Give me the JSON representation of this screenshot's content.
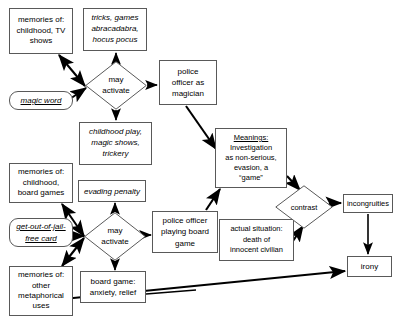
{
  "diagram": {
    "style": {
      "stroke": "#595959",
      "edge_color": "#000000",
      "background": "#ffffff",
      "text_color": "#000000"
    },
    "nodes": [
      {
        "id": "memories-childhood-tv",
        "shape": "rect",
        "text": "memories of:\nchildhood, TV\nshows",
        "italic": false,
        "x": 9,
        "y": 8,
        "w": 64,
        "h": 46
      },
      {
        "id": "tricks-games",
        "shape": "rect",
        "text": "tricks, games\nabracadabra,\nhocus pocus",
        "italic": true,
        "x": 83,
        "y": 8,
        "w": 64,
        "h": 43
      },
      {
        "id": "magic-word",
        "shape": "rounded",
        "text": "magic word",
        "italic": true,
        "underline": true,
        "x": 9,
        "y": 91,
        "w": 64,
        "h": 19
      },
      {
        "id": "may-activate-top",
        "shape": "diamond",
        "text": "may\nactivate",
        "italic": false,
        "x": 85,
        "y": 61,
        "w": 62,
        "h": 49
      },
      {
        "id": "police-officer-magician",
        "shape": "rect",
        "text": "police\nofficer as\nmagician",
        "italic": false,
        "x": 159,
        "y": 60,
        "w": 58,
        "h": 45
      },
      {
        "id": "childhood-play",
        "shape": "rect",
        "text": "childhood play,\nmagic shows,\ntrickery",
        "italic": true,
        "x": 79,
        "y": 122,
        "w": 73,
        "h": 43
      },
      {
        "id": "meanings",
        "shape": "rect",
        "text": "Investigation\nas non-serious,\nevasion, a\n“game”",
        "heading": "Meanings:",
        "italic": false,
        "x": 215,
        "y": 128,
        "w": 72,
        "h": 60
      },
      {
        "id": "memories-childhood-board-games",
        "shape": "rect",
        "text": "memories of:\nchildhood,\nboard games",
        "italic": false,
        "x": 9,
        "y": 163,
        "w": 64,
        "h": 40
      },
      {
        "id": "evading-penalty",
        "shape": "rect",
        "text": "evading penalty",
        "italic": true,
        "x": 78,
        "y": 180,
        "w": 68,
        "h": 22
      },
      {
        "id": "get-out-of-jail-free-card",
        "shape": "rounded",
        "text": "get-out-of-jail-\nfree card",
        "italic": true,
        "underline": true,
        "x": 9,
        "y": 218,
        "w": 64,
        "h": 29
      },
      {
        "id": "may-activate-bottom",
        "shape": "diamond",
        "text": "may\nactivate",
        "italic": false,
        "x": 84,
        "y": 212,
        "w": 62,
        "h": 49
      },
      {
        "id": "police-officer-board-game",
        "shape": "rect",
        "text": "police officer\nplaying board\ngame",
        "italic": false,
        "x": 152,
        "y": 211,
        "w": 66,
        "h": 42
      },
      {
        "id": "actual-situation",
        "shape": "rect",
        "text": "actual situation:\ndeath of\ninnocent civilian",
        "italic": false,
        "x": 219,
        "y": 219,
        "w": 75,
        "h": 42
      },
      {
        "id": "contrast",
        "shape": "diamond",
        "text": "contrast",
        "italic": false,
        "x": 275,
        "y": 185,
        "w": 58,
        "h": 44
      },
      {
        "id": "incongruities",
        "shape": "rect",
        "text": "incongruities",
        "italic": false,
        "x": 343,
        "y": 194,
        "w": 50,
        "h": 19
      },
      {
        "id": "irony",
        "shape": "rect",
        "text": "irony",
        "italic": false,
        "x": 347,
        "y": 256,
        "w": 45,
        "h": 21
      },
      {
        "id": "board-game-anxiety",
        "shape": "rect",
        "text": "board game:\nanxiety, relief",
        "italic": false,
        "x": 80,
        "y": 271,
        "w": 66,
        "h": 32
      },
      {
        "id": "memories-other-metaphorical",
        "shape": "rect",
        "text": "memories of:\nother\nmetaphorical\nuses",
        "italic": false,
        "x": 9,
        "y": 266,
        "w": 64,
        "h": 50
      }
    ],
    "edges": [
      {
        "from": "memories-childhood-tv",
        "to": "may-activate-top",
        "double": true
      },
      {
        "from": "magic-word",
        "to": "may-activate-top",
        "double": false
      },
      {
        "from": "may-activate-top",
        "to": "tricks-games",
        "double": false
      },
      {
        "from": "may-activate-top",
        "to": "childhood-play",
        "double": false
      },
      {
        "from": "may-activate-top",
        "to": "police-officer-magician",
        "double": false
      },
      {
        "from": "police-officer-magician",
        "to": "meanings",
        "double": false
      },
      {
        "from": "police-officer-board-game",
        "to": "meanings",
        "double": false
      },
      {
        "from": "memories-childhood-board-games",
        "to": "may-activate-bottom",
        "double": true
      },
      {
        "from": "get-out-of-jail-free-card",
        "to": "may-activate-bottom",
        "double": false
      },
      {
        "from": "memories-other-metaphorical",
        "to": "may-activate-bottom",
        "double": true
      },
      {
        "from": "may-activate-bottom",
        "to": "evading-penalty",
        "double": false
      },
      {
        "from": "may-activate-bottom",
        "to": "board-game-anxiety",
        "double": false
      },
      {
        "from": "may-activate-bottom",
        "to": "police-officer-board-game",
        "double": false
      },
      {
        "from": "meanings",
        "to": "contrast",
        "double": false
      },
      {
        "from": "actual-situation",
        "to": "contrast",
        "double": false
      },
      {
        "from": "contrast",
        "to": "incongruities",
        "double": false
      },
      {
        "from": "incongruities",
        "to": "irony",
        "double": false
      },
      {
        "from": "memories-other-metaphorical",
        "to": "irony",
        "double": false
      }
    ]
  }
}
